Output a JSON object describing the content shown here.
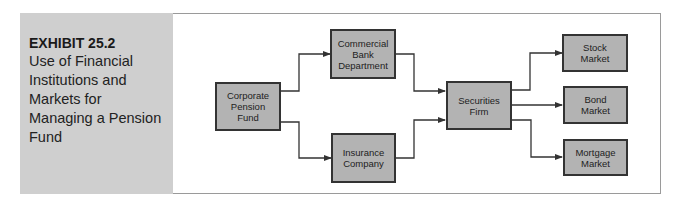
{
  "exhibit": {
    "label": "EXHIBIT 25.2",
    "caption": "Use of Financial Institutions and Markets for Managing a Pension Fund"
  },
  "diagram": {
    "nodes": [
      {
        "id": "corporate-pension-fund",
        "label": "Corporate\nPension\nFund"
      },
      {
        "id": "commercial-bank-department",
        "label": "Commercial\nBank\nDepartment"
      },
      {
        "id": "insurance-company",
        "label": "Insurance\nCompany"
      },
      {
        "id": "securities-firm",
        "label": "Securities\nFirm"
      },
      {
        "id": "stock-market",
        "label": "Stock\nMarket"
      },
      {
        "id": "bond-market",
        "label": "Bond\nMarket"
      },
      {
        "id": "mortgage-market",
        "label": "Mortgage\nMarket"
      }
    ],
    "edges": [
      {
        "from": "corporate-pension-fund",
        "to": "commercial-bank-department"
      },
      {
        "from": "corporate-pension-fund",
        "to": "insurance-company"
      },
      {
        "from": "commercial-bank-department",
        "to": "securities-firm"
      },
      {
        "from": "insurance-company",
        "to": "securities-firm"
      },
      {
        "from": "securities-firm",
        "to": "stock-market"
      },
      {
        "from": "securities-firm",
        "to": "bond-market"
      },
      {
        "from": "securities-firm",
        "to": "mortgage-market"
      }
    ],
    "colors": {
      "box_fill": "#b3b3b3",
      "box_border": "#333333",
      "side_panel": "#cfcfcf"
    }
  }
}
